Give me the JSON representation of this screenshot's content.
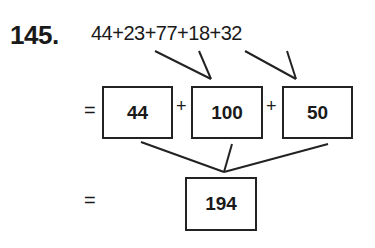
{
  "problem": {
    "number": "145.",
    "expression": "44+23+77+18+32",
    "step1": {
      "equals": "=",
      "terms": [
        "44",
        "100",
        "50"
      ],
      "operator": "+"
    },
    "step2": {
      "equals": "=",
      "result": "194"
    }
  }
}
